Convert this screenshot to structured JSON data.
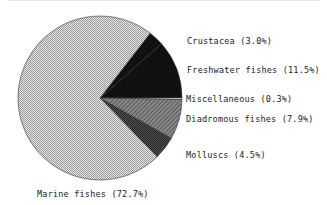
{
  "chart_data": {
    "type": "pie",
    "title": "",
    "slices": [
      {
        "label": "Crustacea",
        "value": 3.0,
        "display": "Crustacea (3.0%)",
        "fill": "#1a1a1a"
      },
      {
        "label": "Freshwater fishes",
        "value": 11.5,
        "display": "Freshwater fishes (11.5%)",
        "fill": "#111111"
      },
      {
        "label": "Miscellaneous",
        "value": 0.3,
        "display": "Miscellaneous (0.3%)",
        "fill": "#ffffff"
      },
      {
        "label": "Diadromous fishes",
        "value": 7.9,
        "display": "Diadromous fishes (7.9%)",
        "fill": "#7a7a7a"
      },
      {
        "label": "Molluscs",
        "value": 4.5,
        "display": "Molluscs (4.5%)",
        "fill": "#3c3c3c"
      },
      {
        "label": "Marine fishes",
        "value": 72.7,
        "display": "Marine fishes (72.7%)",
        "fill": "#c8c8c8"
      }
    ],
    "legend_position": "labels beside slices"
  },
  "labels": {
    "crustacea": "Crustacea (3.0%)",
    "freshwater": "Freshwater fishes (11.5%)",
    "misc": "Miscellaneous (0.3%)",
    "diadromous": "Diadromous fishes (7.9%)",
    "molluscs": "Molluscs (4.5%)",
    "marine": "Marine fishes (72.7%)"
  }
}
